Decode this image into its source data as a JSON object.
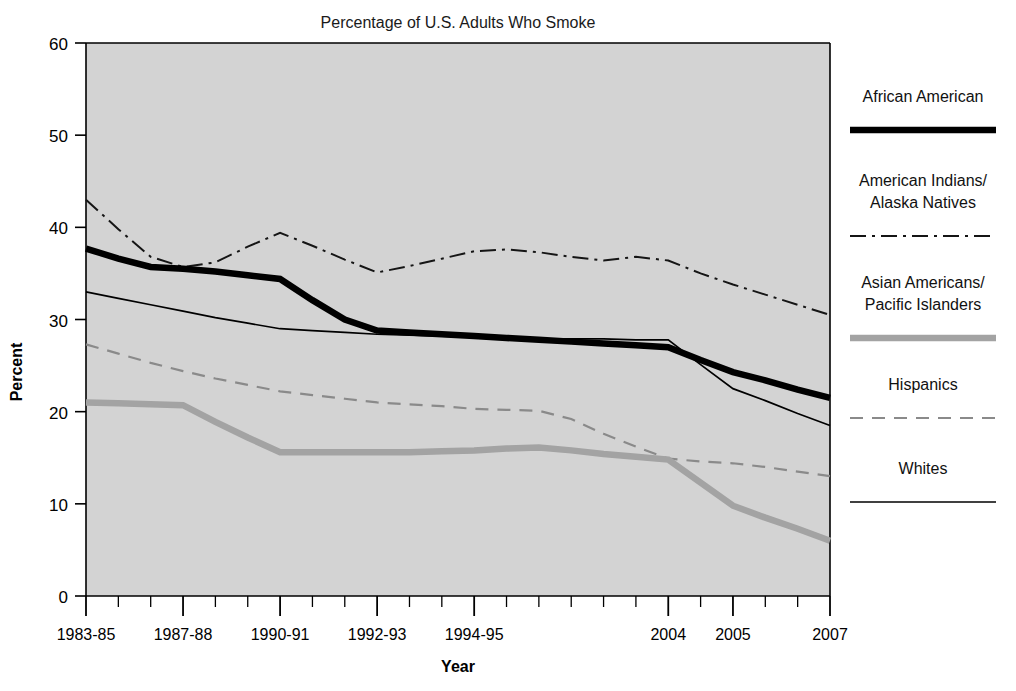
{
  "chart_data": {
    "type": "line",
    "title": "Percentage of U.S. Adults Who Smoke",
    "xlabel": "Year",
    "ylabel": "Percent",
    "ylim": [
      0,
      60
    ],
    "yticks": [
      0,
      10,
      20,
      30,
      40,
      50,
      60
    ],
    "ytick_labels": [
      "0",
      "10",
      "20",
      "30",
      "40",
      "50",
      "60"
    ],
    "grid": false,
    "legend_position": "right",
    "categories": [
      "1983-85",
      "1987-88",
      "1990-91",
      "1992-93",
      "1994-95",
      "2004",
      "2005",
      "2007"
    ],
    "x_major_positions": [
      0,
      3,
      6,
      9,
      12,
      18,
      20,
      23
    ],
    "x_total_ticks": 24,
    "series": [
      {
        "name": "African American",
        "style": "solid-thick-black",
        "color": "#000000",
        "x": [
          0,
          1,
          2,
          3,
          4,
          5,
          6,
          7,
          8,
          9,
          10,
          11,
          12,
          13,
          14,
          15,
          16,
          17,
          18,
          19,
          20,
          21,
          22,
          23
        ],
        "values": [
          37.7,
          36.6,
          35.7,
          35.5,
          35.2,
          34.8,
          34.4,
          32.1,
          30.0,
          28.8,
          28.6,
          28.4,
          28.2,
          28.0,
          27.8,
          27.6,
          27.4,
          27.2,
          27.0,
          25.6,
          24.3,
          23.4,
          22.4,
          21.5
        ]
      },
      {
        "name": "American Indians/Alaska Natives",
        "style": "dash-dot-black",
        "color": "#000000",
        "x": [
          0,
          1,
          2,
          3,
          4,
          5,
          6,
          7,
          8,
          9,
          10,
          11,
          12,
          13,
          14,
          15,
          16,
          17,
          18,
          19,
          20,
          21,
          22,
          23
        ],
        "values": [
          43.0,
          39.8,
          36.8,
          35.7,
          36.2,
          37.9,
          39.4,
          38.0,
          36.5,
          35.1,
          35.8,
          36.6,
          37.4,
          37.6,
          37.3,
          36.8,
          36.4,
          36.8,
          36.4,
          35.0,
          33.8,
          32.7,
          31.6,
          30.5
        ]
      },
      {
        "name": "Asian Americans/Pacific Islanders",
        "style": "solid-thick-gray",
        "color": "#a3a3a3",
        "x": [
          0,
          1,
          2,
          3,
          4,
          5,
          6,
          7,
          8,
          9,
          10,
          11,
          12,
          13,
          14,
          15,
          16,
          17,
          18,
          19,
          20,
          21,
          22,
          23
        ],
        "values": [
          21.0,
          20.9,
          20.8,
          20.7,
          18.9,
          17.2,
          15.6,
          15.6,
          15.6,
          15.6,
          15.6,
          15.7,
          15.8,
          16.0,
          16.1,
          15.8,
          15.4,
          15.1,
          14.8,
          12.3,
          9.8,
          8.5,
          7.3,
          6.0
        ]
      },
      {
        "name": "Hispanics",
        "style": "dashed-gray",
        "color": "#8a8a8a",
        "x": [
          0,
          1,
          2,
          3,
          4,
          5,
          6,
          7,
          8,
          9,
          10,
          11,
          12,
          13,
          14,
          15,
          16,
          17,
          18,
          19,
          20,
          21,
          22,
          23
        ],
        "values": [
          27.3,
          26.3,
          25.3,
          24.4,
          23.6,
          22.9,
          22.2,
          21.8,
          21.4,
          21.0,
          20.8,
          20.6,
          20.3,
          20.2,
          20.1,
          19.2,
          17.6,
          16.2,
          14.9,
          14.6,
          14.4,
          14.0,
          13.5,
          13.0
        ]
      },
      {
        "name": "Whites",
        "style": "solid-thin-black",
        "color": "#000000",
        "x": [
          0,
          1,
          2,
          3,
          4,
          5,
          6,
          7,
          8,
          9,
          10,
          11,
          12,
          13,
          14,
          15,
          16,
          17,
          18,
          19,
          20,
          21,
          22,
          23
        ],
        "values": [
          33.0,
          32.3,
          31.6,
          30.9,
          30.2,
          29.6,
          29.0,
          28.8,
          28.6,
          28.4,
          28.3,
          28.2,
          28.1,
          28.0,
          27.9,
          27.9,
          27.9,
          27.8,
          27.8,
          25.1,
          22.5,
          21.2,
          19.8,
          18.5
        ]
      }
    ]
  },
  "legend": {
    "entries": [
      {
        "label": "African American",
        "label_line2": "",
        "style": "solid-thick-black"
      },
      {
        "label": "American Indians/",
        "label_line2": "Alaska Natives",
        "style": "dash-dot-black"
      },
      {
        "label": "Asian Americans/",
        "label_line2": "Pacific Islanders",
        "style": "solid-thick-gray"
      },
      {
        "label": "Hispanics",
        "label_line2": "",
        "style": "dashed-gray"
      },
      {
        "label": "Whites",
        "label_line2": "",
        "style": "solid-thin-black"
      }
    ]
  },
  "colors": {
    "plot_background": "#d3d3d3",
    "page_background": "#ffffff",
    "axis": "#000000",
    "black_series": "#000000",
    "gray_series": "#a3a3a3",
    "dashed_gray_series": "#8a8a8a"
  }
}
